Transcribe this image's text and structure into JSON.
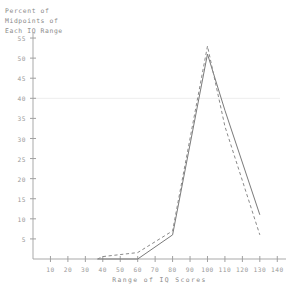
{
  "chart_data": {
    "type": "line",
    "title": "Percent of Midpoints of Each IQ Range",
    "title_lines": [
      "Percent  of",
      "Midpoints  of",
      "Each  IQ  Range"
    ],
    "xlabel": "Range  of   IQ   Scores",
    "ylabel": "",
    "xlim": [
      0,
      145
    ],
    "ylim": [
      0,
      57
    ],
    "xticks": [
      10,
      20,
      30,
      40,
      50,
      60,
      70,
      80,
      90,
      100,
      110,
      120,
      130,
      140
    ],
    "xtick_labels": [
      "10",
      "20",
      "30",
      "40",
      "50",
      "60",
      "70",
      "80",
      "90",
      "100",
      "110",
      "120",
      "130",
      "140"
    ],
    "yticks": [
      5,
      10,
      15,
      20,
      25,
      30,
      35,
      40,
      45,
      50,
      55
    ],
    "ytick_labels": [
      "5",
      "10",
      "15",
      "20",
      "25",
      "30",
      "35",
      "40",
      "45",
      "50",
      "55"
    ],
    "grid": false,
    "gridlines_y": [
      40
    ],
    "legend": null,
    "legend_position": "none",
    "series": [
      {
        "name": "solid",
        "style": "solid",
        "color": "#7a7a7a",
        "x": [
          37,
          60,
          80,
          100,
          110,
          130
        ],
        "values": [
          0,
          0,
          6,
          51,
          37,
          11
        ]
      },
      {
        "name": "dashed",
        "style": "dashed",
        "color": "#8a8a8a",
        "x": [
          37,
          40,
          60,
          80,
          100,
          110,
          130
        ],
        "values": [
          0,
          0.6,
          1.6,
          7,
          53,
          33,
          6
        ]
      }
    ]
  },
  "axis": {
    "x_caption": "Range  of   IQ   Scores"
  }
}
